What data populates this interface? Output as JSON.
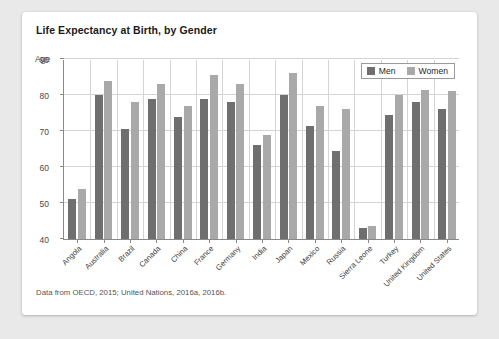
{
  "card": {
    "title": "Life Expectancy at Birth, by Gender",
    "source_note": "Data from OECD, 2015; United Nations, 2016a, 2016b.",
    "axis_unit_label": "Age"
  },
  "legend": {
    "men_label": "Men",
    "women_label": "Women",
    "men_color": "#6f6f6f",
    "women_color": "#a9a9a9"
  },
  "chart_data": {
    "type": "bar",
    "title": "Life Expectancy at Birth, by Gender",
    "xlabel": "",
    "ylabel": "Age",
    "ylim": [
      40,
      90
    ],
    "yticks": [
      40,
      50,
      60,
      70,
      80,
      90
    ],
    "grid": true,
    "legend_position": "top-right",
    "categories": [
      "Angola",
      "Australia",
      "Brazil",
      "Canada",
      "China",
      "France",
      "Germany",
      "India",
      "Japan",
      "Mexico",
      "Russia",
      "Sierra Leone",
      "Turkey",
      "United Kingdom",
      "United States"
    ],
    "series": [
      {
        "name": "Men",
        "color": "#6f6f6f",
        "values": [
          51,
          80,
          70.5,
          79,
          74,
          79,
          78,
          66,
          80,
          71.5,
          64.5,
          43,
          74.5,
          78,
          76
        ]
      },
      {
        "name": "Women",
        "color": "#a9a9a9",
        "values": [
          54,
          84,
          78,
          83,
          77,
          85.5,
          83,
          69,
          86,
          77,
          76,
          43.5,
          80,
          81.5,
          81
        ]
      }
    ]
  }
}
